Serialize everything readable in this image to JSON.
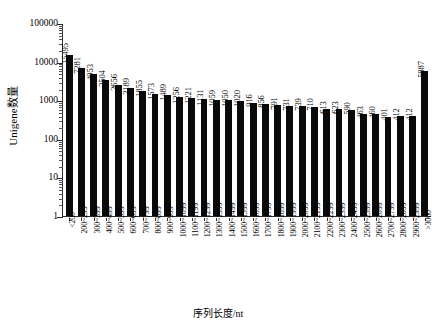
{
  "chart_data": {
    "type": "bar",
    "title": "",
    "xlabel": "序列长度/nt",
    "ylabel": "Unigene数量",
    "yscale": "log",
    "ylim": [
      1,
      100000
    ],
    "ytick_labels": [
      "100000",
      "10000",
      "1000",
      "100",
      "10",
      "1"
    ],
    "ytick_values": [
      100000,
      10000,
      1000,
      100,
      10,
      1
    ],
    "grid": false,
    "legend": false,
    "bar_color": "#0a0a0a",
    "categories": [
      "<200",
      "200~299",
      "300~399",
      "400~499",
      "500~599",
      "600~699",
      "700~799",
      "800~899",
      "900~999",
      "1000~1099",
      "1100~1199",
      "1200~1299",
      "1300~1399",
      "1400~1499",
      "1500~1599",
      "1600~1699",
      "1700~1799",
      "1800~1899",
      "1900~1999",
      "2000~2099",
      "2100~2199",
      "2200~2299",
      "2300~2399",
      "2400~2499",
      "2500~2599",
      "2600~2699",
      "2700~2799",
      "2800~2899",
      "2900~2999",
      ">3000"
    ],
    "values": [
      15495,
      7281,
      4953,
      3504,
      2656,
      2189,
      1855,
      1573,
      1489,
      1256,
      1221,
      1131,
      1059,
      1050,
      1020,
      916,
      856,
      791,
      731,
      739,
      710,
      613,
      623,
      590,
      463,
      460,
      401,
      412,
      412,
      5887
    ],
    "data_labels": [
      "15495",
      "7281",
      "4953",
      "3504",
      "2656",
      "2189",
      "1855",
      "1573",
      "1489",
      "1256",
      "1221",
      "1131",
      "1059",
      "1050",
      "1020",
      "916",
      "856",
      "791",
      "731",
      "739",
      "710",
      "613",
      "623",
      "590",
      "463",
      "460",
      "401",
      "412",
      "412",
      "5887"
    ]
  }
}
